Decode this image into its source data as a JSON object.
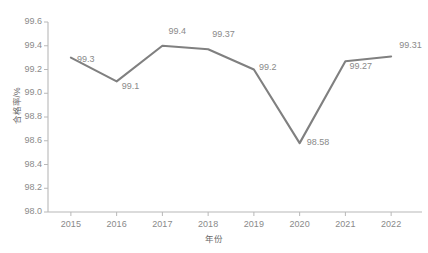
{
  "chart_data": {
    "type": "line",
    "title": "",
    "xlabel": "年份",
    "ylabel": "合格率/%",
    "categories": [
      "2015",
      "2016",
      "2017",
      "2018",
      "2019",
      "2020",
      "2021",
      "2022"
    ],
    "values": [
      99.3,
      99.1,
      99.4,
      99.37,
      99.2,
      98.58,
      99.27,
      99.31
    ],
    "point_labels": [
      "99.3",
      "99.1",
      "99.4",
      "99.37",
      "99.2",
      "98.58",
      "99.27",
      "99.31"
    ],
    "series": [
      {
        "name": "合格率",
        "values": [
          99.3,
          99.1,
          99.4,
          99.37,
          99.2,
          98.58,
          99.27,
          99.31
        ]
      }
    ],
    "ylim": [
      98.0,
      99.6
    ],
    "ytick_labels": [
      "98.0",
      "98.2",
      "98.4",
      "98.6",
      "98.8",
      "99.0",
      "99.2",
      "99.4",
      "99.6"
    ],
    "ytick_values": [
      98.0,
      98.2,
      98.4,
      98.6,
      98.8,
      99.0,
      99.2,
      99.4,
      99.6
    ],
    "xtick_labels": [
      "2015",
      "2016",
      "2017",
      "2018",
      "2019",
      "2020",
      "2021",
      "2022"
    ],
    "grid": false,
    "legend": "none",
    "line_color": "#808080",
    "text_color": "#8a8a8a",
    "axis_color": "#b8b8b8",
    "background": "#ffffff"
  }
}
